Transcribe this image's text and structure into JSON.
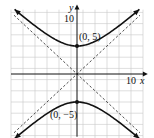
{
  "chart_data": {
    "type": "line",
    "title": "",
    "xlabel": "x",
    "ylabel": "y",
    "xlim": [
      -10,
      10
    ],
    "ylim": [
      -10,
      10
    ],
    "grid": true,
    "grid_step": 2,
    "tick_labels": {
      "x": "10",
      "y": "10"
    },
    "equation": "y^2/25 - x^2/25 = 1",
    "series": [
      {
        "name": "hyperbola-upper-branch",
        "kind": "curve",
        "style": "solid",
        "function": "y = sqrt(25 + x^2)"
      },
      {
        "name": "hyperbola-lower-branch",
        "kind": "curve",
        "style": "solid",
        "function": "y = -sqrt(25 + x^2)"
      },
      {
        "name": "asymptote-positive",
        "kind": "line",
        "style": "dashed",
        "slope": 1,
        "intercept": 0
      },
      {
        "name": "asymptote-negative",
        "kind": "line",
        "style": "dashed",
        "slope": -1,
        "intercept": 0
      }
    ],
    "points": [
      {
        "label": "(0, 5)",
        "x": 0,
        "y": 5
      },
      {
        "label": "(0, −5)",
        "x": 0,
        "y": -5
      }
    ]
  }
}
